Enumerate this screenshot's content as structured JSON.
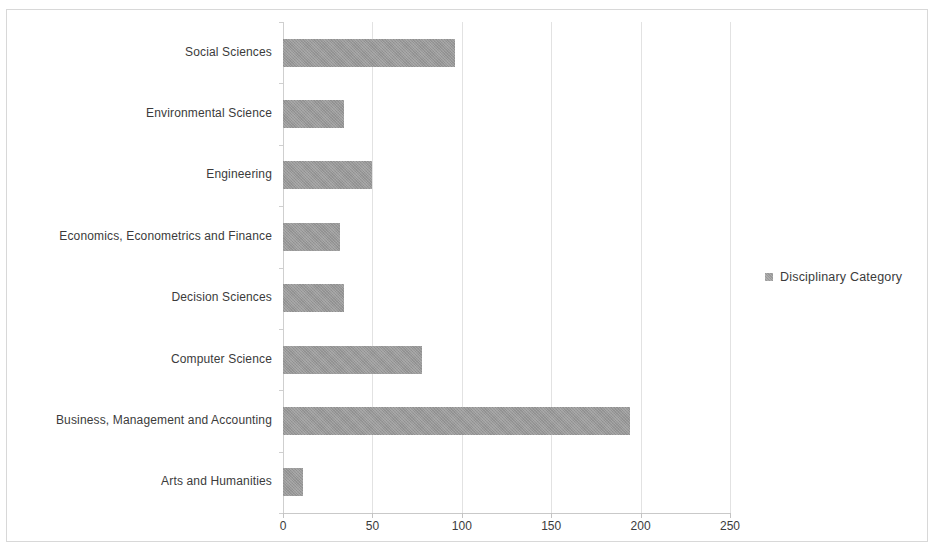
{
  "chart_data": {
    "type": "bar",
    "orientation": "horizontal",
    "title": "",
    "xlabel": "",
    "ylabel": "",
    "xlim": [
      0,
      250
    ],
    "xticks": [
      0,
      50,
      100,
      150,
      200,
      250
    ],
    "xtick_labels": [
      "0",
      "50",
      "100",
      "150",
      "200",
      "250"
    ],
    "grid": "vertical",
    "legend_position": "right",
    "series": [
      {
        "name": "Disciplinary Category",
        "color": "#989898",
        "values": [
          96,
          34,
          50,
          32,
          34,
          78,
          194,
          11
        ]
      }
    ],
    "categories": [
      "Social Sciences",
      "Environmental Science",
      "Engineering",
      "Economics, Econometrics and Finance",
      "Decision Sciences",
      "Computer Science",
      "Business, Management and Accounting",
      "Arts and Humanities"
    ]
  },
  "legend": {
    "label": "Disciplinary Category",
    "swatch_color": "#9a9a9a"
  },
  "colors": {
    "bar": "#989898",
    "gridline": "#e2e2e2",
    "axis": "#c9c9c9",
    "text": "#3b3b3b",
    "frame": "#d8d8d8",
    "background": "#ffffff"
  }
}
